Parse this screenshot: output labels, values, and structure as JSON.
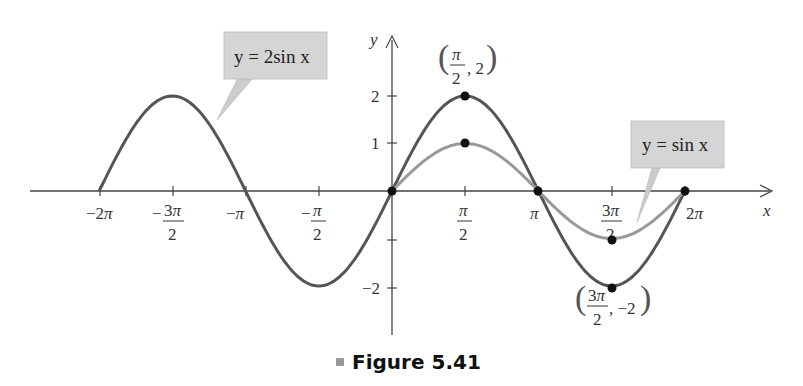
{
  "chart_data": {
    "type": "line",
    "title": "Figure 5.41",
    "xlabel": "x",
    "ylabel": "y",
    "xlim": [
      -6.2832,
      6.2832
    ],
    "ylim": [
      -2,
      2
    ],
    "x_ticks": [
      "-2π",
      "-3π/2",
      "-π",
      "-π/2",
      "π/2",
      "π",
      "3π/2",
      "2π"
    ],
    "y_ticks": [
      "2",
      "1",
      "-2"
    ],
    "grid": false,
    "series": [
      {
        "name": "y = 2sin x",
        "function": "2*sin(x)",
        "domain": [
          -6.2832,
          6.2832
        ],
        "color": "#555555"
      },
      {
        "name": "y = sin x",
        "function": "sin(x)",
        "domain": [
          0,
          6.2832
        ],
        "color": "#999999"
      }
    ],
    "key_points": {
      "y = 2sin x": [
        [
          "0",
          0
        ],
        [
          "π/2",
          2
        ],
        [
          "π",
          0
        ],
        [
          "3π/2",
          -2
        ],
        [
          "2π",
          0
        ]
      ],
      "y = sin x": [
        [
          "0",
          0
        ],
        [
          "π/2",
          1
        ],
        [
          "π",
          0
        ],
        [
          "3π/2",
          -1
        ],
        [
          "2π",
          0
        ]
      ]
    },
    "annotations": [
      "(π/2, 2)",
      "(3π/2, −2)",
      "y = 2sin x",
      "y = sin x"
    ]
  },
  "labels": {
    "x_axis": "x",
    "y_axis": "y",
    "callout_2sin": "y = 2sin x",
    "callout_sin": "y = sin x",
    "point_max": "(π/2, 2)",
    "point_min": "(3π/2, −2)",
    "caption": "Figure 5.41"
  }
}
